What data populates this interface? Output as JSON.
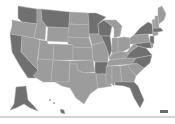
{
  "map": {
    "type": "choropleth",
    "region": "United States",
    "colors": {
      "high": "#707070",
      "low": "#9c9c9c",
      "border": "#b8b8b8",
      "background": "#ffffff"
    },
    "states": {
      "WA": "high",
      "OR": "low",
      "CA": "high",
      "ID": "low",
      "NV": "low",
      "MT": "high",
      "WY": "low",
      "UT": "low",
      "AZ": "low",
      "CO": "low",
      "NM": "low",
      "ND": "low",
      "SD": "low",
      "NE": "low",
      "KS": "low",
      "OK": "low",
      "TX": "low",
      "MN": "high",
      "IA": "low",
      "MO": "low",
      "AR": "high",
      "LA": "low",
      "WI": "high",
      "IL": "high",
      "MI": "low",
      "IN": "low",
      "OH": "low",
      "KY": "low",
      "TN": "low",
      "MS": "low",
      "AL": "low",
      "GA": "low",
      "FL": "high",
      "SC": "low",
      "NC": "high",
      "VA": "high",
      "WV": "low",
      "PA": "low",
      "NY": "high",
      "ME": "low",
      "NH": "low",
      "VT": "low",
      "MA": "high",
      "CT": "low",
      "NJ": "high",
      "DE": "low",
      "MD": "high",
      "AK": "high",
      "HI": "high"
    }
  }
}
